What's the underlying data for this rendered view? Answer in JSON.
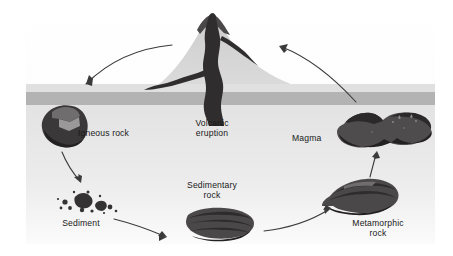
{
  "diagram": {
    "background_color": "#ffffff",
    "sky_color": "#f2f2f2",
    "ground_top_color": "#e4e4e4",
    "ground_band_color": "#b4b4b4",
    "subsurface_color": "#e9e9e9",
    "volcano_color": "#d2d2d2",
    "rock_dark_color": "#3c3c3c",
    "rock_mid_color": "#595959",
    "rock_light_color": "#8d8d8d",
    "arrow_color": "#3a3a3a",
    "label_color": "#1a1a1a"
  },
  "labels": {
    "igneous_rock": "Igneous rock",
    "volcanic_eruption": "Volcanic\neruption",
    "magma": "Magma",
    "sediment": "Sediment",
    "sedimentary_rock": "Sedimentary\nrock",
    "metamorphic_rock": "Metamorphic\nrock"
  },
  "stages": [
    {
      "id": "volcanic-eruption",
      "label": "Volcanic eruption",
      "x": 212,
      "y": 60
    },
    {
      "id": "igneous-rock",
      "label": "Igneous rock",
      "x": 62,
      "y": 132
    },
    {
      "id": "sediment",
      "label": "Sediment",
      "x": 80,
      "y": 205
    },
    {
      "id": "sedimentary-rock",
      "label": "Sedimentary rock",
      "x": 212,
      "y": 225
    },
    {
      "id": "metamorphic-rock",
      "label": "Metamorphic rock",
      "x": 372,
      "y": 196
    },
    {
      "id": "magma",
      "label": "Magma",
      "x": 378,
      "y": 132
    }
  ],
  "arrows": [
    {
      "id": "eruption-to-igneous",
      "from": "volcanic-eruption",
      "to": "igneous-rock"
    },
    {
      "id": "igneous-to-sediment",
      "from": "igneous-rock",
      "to": "sediment"
    },
    {
      "id": "sediment-to-sedimentary",
      "from": "sediment",
      "to": "sedimentary-rock"
    },
    {
      "id": "sedimentary-to-metamorphic",
      "from": "sedimentary-rock",
      "to": "metamorphic-rock"
    },
    {
      "id": "metamorphic-to-magma",
      "from": "metamorphic-rock",
      "to": "magma"
    },
    {
      "id": "magma-to-eruption",
      "from": "magma",
      "to": "volcanic-eruption"
    }
  ]
}
